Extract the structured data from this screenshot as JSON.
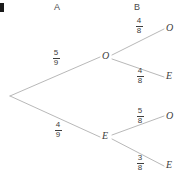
{
  "diagram": {
    "type": "probability-tree",
    "title": "",
    "columns": [
      {
        "id": "a",
        "label": "A"
      },
      {
        "id": "b",
        "label": "B"
      }
    ],
    "root": {
      "label": ""
    },
    "stage_a": {
      "branches": [
        {
          "id": "a-o",
          "outcome": "O",
          "probability": "5/9",
          "numerator": "5",
          "denominator": "9"
        },
        {
          "id": "a-e",
          "outcome": "E",
          "probability": "4/9",
          "numerator": "4",
          "denominator": "9"
        }
      ]
    },
    "stage_b": {
      "from_o": [
        {
          "id": "o-o",
          "outcome": "O",
          "probability": "4/8",
          "numerator": "4",
          "denominator": "8"
        },
        {
          "id": "o-e",
          "outcome": "E",
          "probability": "4/8",
          "numerator": "4",
          "denominator": "8"
        }
      ],
      "from_e": [
        {
          "id": "e-o",
          "outcome": "O",
          "probability": "5/8",
          "numerator": "5",
          "denominator": "8"
        },
        {
          "id": "e-e",
          "outcome": "E",
          "probability": "3/8",
          "numerator": "3",
          "denominator": "8"
        }
      ]
    },
    "colors": {
      "line": "#b0b0b0",
      "text": "#3d3d3d",
      "header": "#4a4a4a",
      "background": "#ffffff",
      "mark": "#1a1a1a"
    }
  }
}
